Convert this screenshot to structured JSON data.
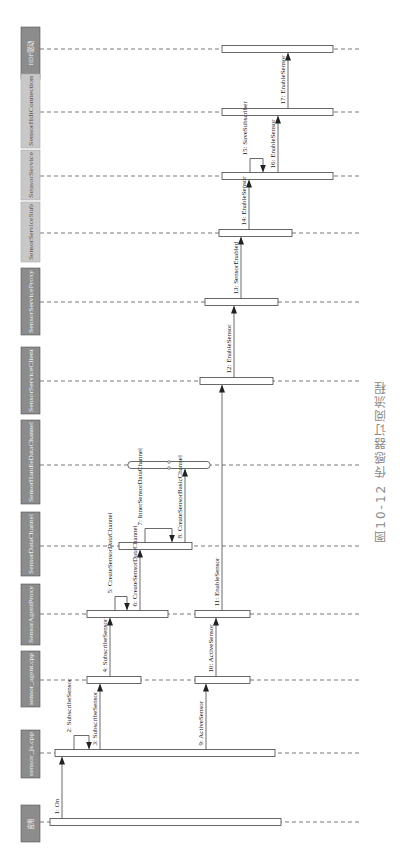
{
  "figure": {
    "caption": "图10-12  传感器订阅流程",
    "orientation": "rotated-90-ccw"
  },
  "participants": [
    {
      "id": "hdf",
      "label": "HDF驱动",
      "y": 49,
      "box": [
        21,
        27,
        40,
        79
      ],
      "dark": true
    },
    {
      "id": "hdi",
      "label": "SensorHdiConnection",
      "y": 112,
      "box": [
        21,
        74,
        40,
        148
      ],
      "dark": false
    },
    {
      "id": "svc",
      "label": "SensorService",
      "y": 176,
      "box": [
        21,
        150,
        40,
        200
      ],
      "dark": false
    },
    {
      "id": "stub",
      "label": "SensorServiceStub",
      "y": 233,
      "box": [
        21,
        202,
        40,
        262
      ],
      "dark": false
    },
    {
      "id": "proxy",
      "label": "SensorServiceProxy",
      "y": 302,
      "box": [
        21,
        268,
        40,
        335
      ],
      "dark": true
    },
    {
      "id": "client",
      "label": "SensorServiceClient",
      "y": 381,
      "box": [
        21,
        347,
        40,
        414
      ],
      "dark": true
    },
    {
      "id": "hdc",
      "label": "SensorHandleDataChannel",
      "y": 465,
      "box": [
        21,
        420,
        40,
        504
      ],
      "dark": true
    },
    {
      "id": "dc",
      "label": "SensorDataChannel",
      "y": 546,
      "box": [
        21,
        512,
        40,
        576
      ],
      "dark": true
    },
    {
      "id": "ap",
      "label": "SensorAgentProxy",
      "y": 614,
      "box": [
        21,
        584,
        40,
        645
      ],
      "dark": true
    },
    {
      "id": "agent",
      "label": "sensor_agent.cpp",
      "y": 680,
      "box": [
        21,
        651,
        40,
        707
      ],
      "dark": true
    },
    {
      "id": "js",
      "label": "sensor_js.cpp",
      "y": 753,
      "box": [
        21,
        730,
        40,
        778
      ],
      "dark": true
    },
    {
      "id": "app",
      "label": "应用",
      "y": 822,
      "box": [
        21,
        805,
        40,
        842
      ],
      "dark": true
    }
  ],
  "activations": [
    {
      "on": "hdf",
      "x1": 222,
      "x2": 333
    },
    {
      "on": "hdi",
      "x1": 222,
      "x2": 333
    },
    {
      "on": "svc",
      "x1": 222,
      "x2": 333
    },
    {
      "on": "stub",
      "x1": 219,
      "x2": 292
    },
    {
      "on": "proxy",
      "x1": 205,
      "x2": 278
    },
    {
      "on": "client",
      "x1": 200,
      "x2": 273
    },
    {
      "on": "hdc",
      "x1": 128,
      "x2": 210
    },
    {
      "on": "dc",
      "x1": 119,
      "x2": 192
    },
    {
      "on": "ap",
      "x1": 87,
      "x2": 168
    },
    {
      "on": "ap",
      "x1": 195,
      "x2": 250
    },
    {
      "on": "agent",
      "x1": 87,
      "x2": 141
    },
    {
      "on": "agent",
      "x1": 195,
      "x2": 250
    },
    {
      "on": "js",
      "x1": 55,
      "x2": 275
    },
    {
      "on": "app",
      "x1": 50,
      "x2": 281
    }
  ],
  "messages": [
    {
      "n": "1:",
      "label": "On",
      "from": "app",
      "to": "js",
      "x": 62,
      "self": false
    },
    {
      "n": "2:",
      "label": "SubscribeSensor",
      "from": "js",
      "to": "js",
      "x": 74,
      "self": true,
      "x2": 89
    },
    {
      "n": "3:",
      "label": "SubscribeSensor",
      "from": "js",
      "to": "agent",
      "x": 100,
      "self": false
    },
    {
      "n": "4:",
      "label": "SubscribeSensor",
      "from": "agent",
      "to": "ap",
      "x": 110,
      "self": false
    },
    {
      "n": "5:",
      "label": "CreateSensorDataChannel",
      "from": "ap",
      "to": "ap",
      "x": 115,
      "self": true,
      "x2": 127
    },
    {
      "n": "6:",
      "label": "CreateSensorDataChannel",
      "from": "ap",
      "to": "dc",
      "x": 140,
      "self": false
    },
    {
      "n": "7:",
      "label": "InnerSensorDataChannel",
      "from": "dc",
      "to": "dc",
      "x": 145,
      "self": true,
      "x2": 172
    },
    {
      "n": "8:",
      "label": "CreateSensorBasicChannel",
      "from": "dc",
      "to": "hdc",
      "x": 185,
      "self": false
    },
    {
      "n": "9:",
      "label": "ActiveSensor",
      "from": "js",
      "to": "agent",
      "x": 206,
      "self": false
    },
    {
      "n": "10:",
      "label": "ActiveSensor",
      "from": "agent",
      "to": "ap",
      "x": 216,
      "self": false
    },
    {
      "n": "11:",
      "label": "EnableSensor",
      "from": "ap",
      "to": "client",
      "x": 222,
      "self": false
    },
    {
      "n": "12:",
      "label": "EnableSensor",
      "from": "client",
      "to": "proxy",
      "x": 234,
      "self": false
    },
    {
      "n": "13:",
      "label": "SensorEnabled",
      "from": "proxy",
      "to": "stub",
      "x": 241,
      "self": false
    },
    {
      "n": "14:",
      "label": "EnableSensor",
      "from": "stub",
      "to": "svc",
      "x": 249,
      "self": false
    },
    {
      "n": "15:",
      "label": "SaveSubscriber",
      "from": "svc",
      "to": "svc",
      "x": 250,
      "self": true,
      "x2": 263
    },
    {
      "n": "16:",
      "label": "EnableSensor",
      "from": "svc",
      "to": "hdi",
      "x": 278,
      "self": false
    },
    {
      "n": "17:",
      "label": "EnableSensor",
      "from": "hdi",
      "to": "hdf",
      "x": 288,
      "self": false
    }
  ],
  "colors": {
    "box_dark": "#8c8c8c",
    "box_light": "#c8c8c8",
    "box_text_dark": "#f2f2f2",
    "box_text_light": "#555555",
    "line": "#444444",
    "dash": "#555555",
    "caption": "#8a8a8a"
  },
  "layout": {
    "lifeline_x_start": 40,
    "lifeline_x_end": 360,
    "bar_thickness": 7
  }
}
